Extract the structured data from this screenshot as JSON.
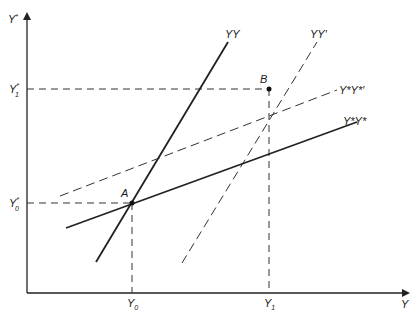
{
  "diagram": {
    "type": "two-country income equilibrium diagram",
    "axes": {
      "x_label": "Y",
      "y_label": "Y*",
      "x_ticks": [
        {
          "label": "Y",
          "sub": "0"
        },
        {
          "label": "Y",
          "sub": "1"
        }
      ],
      "y_ticks": [
        {
          "label": "Y",
          "sup": "*",
          "sub": "0"
        },
        {
          "label": "Y",
          "sup": "*",
          "sub": "1"
        }
      ]
    },
    "curves": [
      {
        "id": "YY",
        "label": "YY",
        "style": "solid"
      },
      {
        "id": "YY_prime",
        "label": "YY′",
        "style": "dashed"
      },
      {
        "id": "YsYs",
        "label": "Y*Y*",
        "style": "solid"
      },
      {
        "id": "YsYs_prime",
        "label": "Y*Y*′",
        "style": "dashed"
      }
    ],
    "points": [
      {
        "id": "A",
        "label": "A"
      },
      {
        "id": "B",
        "label": "B"
      }
    ]
  }
}
